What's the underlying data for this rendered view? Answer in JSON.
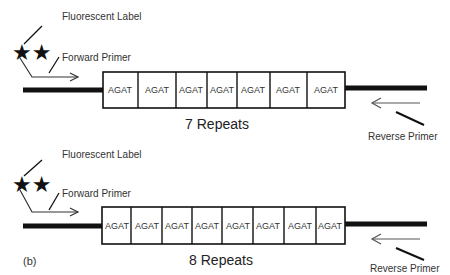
{
  "panels": [
    {
      "id": "a",
      "panel_label": "",
      "fluorescent_label": "Fluorescent Label",
      "forward_primer": "Forward Primer",
      "reverse_primer": "Reverse Primer",
      "repeat_unit": "AGAT",
      "repeat_count": 7,
      "repeats_label": "7 Repeats",
      "cells": [
        "AGAT",
        "AGAT",
        "AGAT",
        "AGAT",
        "AGAT",
        "AGAT",
        "AGAT"
      ]
    },
    {
      "id": "b",
      "panel_label": "(b)",
      "fluorescent_label": "Fluorescent Label",
      "forward_primer": "Forward Primer",
      "reverse_primer": "Reverse Primer",
      "repeat_unit": "AGAT",
      "repeat_count": 8,
      "repeats_label": "8 Repeats",
      "cells": [
        "AGAT",
        "AGAT",
        "AGAT",
        "AGAT",
        "AGAT",
        "AGAT",
        "AGAT",
        "AGAT"
      ]
    }
  ],
  "stars": "★★",
  "colors": {
    "line": "#111111",
    "arrow": "#555555",
    "text": "#333333"
  }
}
